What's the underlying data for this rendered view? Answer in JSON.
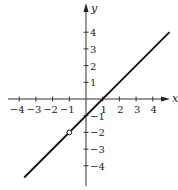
{
  "chart_data": {
    "type": "line",
    "title": "",
    "xlabel": "x",
    "ylabel": "y",
    "xlim": [
      -4.5,
      5
    ],
    "ylim": [
      -5.4,
      5.4
    ],
    "grid": false,
    "x_ticks": [
      -4,
      -3,
      -2,
      -1,
      1,
      2,
      3,
      4
    ],
    "y_ticks": [
      4,
      3,
      2,
      1,
      -1,
      -2,
      -3,
      -4
    ],
    "x_tick_labels": [
      "−4",
      "−3",
      "−2",
      "−1",
      "1",
      "2",
      "3",
      "4"
    ],
    "y_tick_labels": [
      "4",
      "3",
      "2",
      "1",
      "−1",
      "−2",
      "−3",
      "−4"
    ],
    "series": [
      {
        "name": "y = x − 1 (x ≠ −1)",
        "equation": "y = x - 1",
        "x": [
          -3.7,
          5
        ],
        "y": [
          -4.7,
          4
        ],
        "open_points": [
          {
            "x": -1,
            "y": -2
          }
        ]
      }
    ]
  },
  "axes": {
    "x_label": "x",
    "y_label": "y"
  }
}
